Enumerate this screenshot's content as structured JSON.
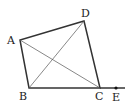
{
  "diagram": {
    "type": "geometry",
    "points": {
      "A": {
        "label": "A",
        "x": 20,
        "y": 40
      },
      "B": {
        "label": "B",
        "x": 29,
        "y": 88
      },
      "C": {
        "label": "C",
        "x": 100,
        "y": 88
      },
      "D": {
        "label": "D",
        "x": 84,
        "y": 21
      },
      "E": {
        "label": "E",
        "x": 116,
        "y": 88
      }
    },
    "segments": [
      {
        "from": "A",
        "to": "B",
        "style": "side"
      },
      {
        "from": "B",
        "to": "C",
        "style": "side"
      },
      {
        "from": "C",
        "to": "D",
        "style": "side"
      },
      {
        "from": "D",
        "to": "A",
        "style": "side"
      },
      {
        "from": "A",
        "to": "C",
        "style": "diagonal"
      },
      {
        "from": "B",
        "to": "D",
        "style": "diagonal"
      },
      {
        "from": "C",
        "to": "E",
        "style": "extension"
      }
    ],
    "line_color": "#333333"
  }
}
